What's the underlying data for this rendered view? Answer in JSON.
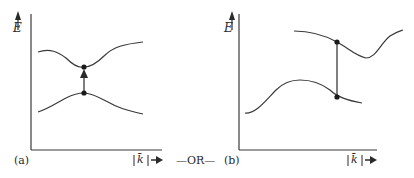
{
  "panels": [
    {
      "id": "a",
      "label": "(a)",
      "y_axis_label": "E",
      "x_axis_label": "|k̄|",
      "x_axis_arrow": "→",
      "transition": "direct (vertical arrow between band extrema at same k)"
    },
    {
      "id": "b",
      "label": "(b)",
      "y_axis_label": "E",
      "x_axis_label": "|k̄|",
      "x_axis_arrow": "→",
      "transition": "vertical line between bands at same k, not at extrema"
    }
  ],
  "separator": "—OR—",
  "colors": {
    "line": "#3a3a3a",
    "text": "#2a2a2a",
    "background": "#ffffff"
  }
}
